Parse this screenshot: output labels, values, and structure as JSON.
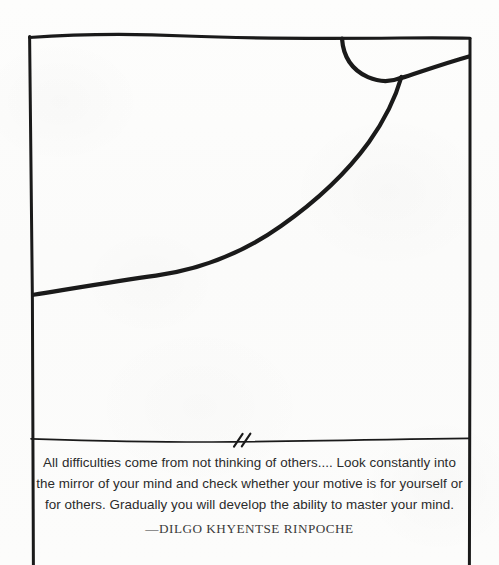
{
  "page": {
    "kind": "scanned-book-page",
    "background_color": "#fcfcfb",
    "ink_color": "#1a1a1a"
  },
  "artwork": {
    "description": "hand-drawn ink line illustration inside a hand-drawn rectangular frame",
    "frame_name": "hand-drawn-frame",
    "shapes": [
      {
        "name": "frame-top-edge"
      },
      {
        "name": "frame-left-edge"
      },
      {
        "name": "frame-right-edge"
      },
      {
        "name": "corner-arc"
      },
      {
        "name": "short-diagonal-to-right-edge"
      },
      {
        "name": "long-sweeping-curve"
      },
      {
        "name": "horizontal-divider-rule"
      },
      {
        "name": "double-slash-break-mark"
      }
    ]
  },
  "quote": {
    "lines": [
      "All difficulties come from not thinking of others.... Look constantly into",
      "the mirror of your mind and check whether your motive is for yourself or",
      "for others. Gradually you will develop the ability to master your mind."
    ],
    "attribution": "—DILGO KHYENTSE RINPOCHE"
  }
}
